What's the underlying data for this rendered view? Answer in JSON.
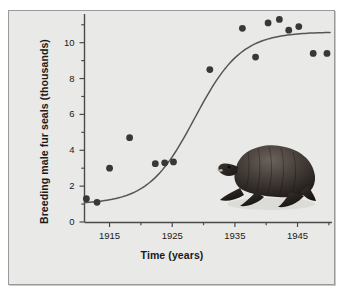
{
  "figure": {
    "background_color": "#e9e9e7",
    "frame_color": "#9a9a98",
    "illustration": "fur-seal-illustration"
  },
  "chart_data": {
    "type": "scatter",
    "title": "",
    "xlabel": "Time (years)",
    "ylabel": "Breeding male fur seals (thousands)",
    "xlim": [
      1911,
      1950.5
    ],
    "ylim": [
      0,
      11.6
    ],
    "grid": false,
    "legend": null,
    "x_major_ticks": [
      1915,
      1925,
      1935,
      1945
    ],
    "x_major_tick_labels": [
      "1915",
      "1925",
      "1935",
      "1945"
    ],
    "x_minor_ticks": [
      1920,
      1930,
      1940,
      1950
    ],
    "y_major_ticks": [
      0,
      2,
      4,
      6,
      8,
      10
    ],
    "y_major_tick_labels": [
      "0",
      "2",
      "4",
      "6",
      "8",
      "10"
    ],
    "y_minor_ticks": [
      1,
      3,
      5,
      7,
      9,
      11
    ],
    "series": [
      {
        "name": "Breeding male fur seals",
        "type": "scatter",
        "marker": "circle",
        "color": "#383838",
        "x": [
          1911.3,
          1913.0,
          1915.0,
          1918.2,
          1922.3,
          1923.8,
          1925.2,
          1931.0,
          1936.2,
          1938.3,
          1940.3,
          1942.1,
          1943.6,
          1945.2,
          1947.5,
          1949.7
        ],
        "y": [
          1.3,
          1.1,
          3.0,
          4.7,
          3.25,
          3.3,
          3.35,
          8.5,
          10.8,
          9.2,
          11.1,
          11.3,
          10.7,
          10.9,
          9.4,
          9.4
        ]
      },
      {
        "name": "Logistic fit curve",
        "type": "line",
        "color": "#555555",
        "asymptote": 10.6,
        "midpoint_year": 1928.6,
        "growth_rate": 0.27,
        "baseline": 1.0
      }
    ]
  }
}
